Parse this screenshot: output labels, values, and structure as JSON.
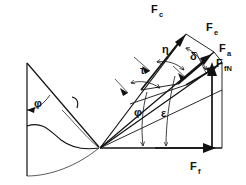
{
  "figure": {
    "background_color": "#ffffff",
    "stroke_color": "#111111"
  },
  "forces": [
    {
      "id": "Fc",
      "base": "F",
      "sub": "c",
      "label": "F_c",
      "label_x": 151,
      "label_y": 13,
      "description": "cutting force vector, upper left of force polygon"
    },
    {
      "id": "Fe",
      "base": "F",
      "sub": "e",
      "label": "F_e",
      "label_x": 206,
      "label_y": 31,
      "description": "effective / resultant force vector"
    },
    {
      "id": "Fa",
      "base": "F",
      "sub": "a",
      "label": "F_a",
      "label_x": 219,
      "label_y": 52,
      "description": "active force vector"
    },
    {
      "id": "FfN",
      "base": "F",
      "sub": "fN",
      "label": "F_fN",
      "label_x": 218,
      "label_y": 66,
      "description": "feed normal force, vertical arrow"
    },
    {
      "id": "Ff",
      "base": "F",
      "sub": "f",
      "label": "F_f",
      "label_x": 190,
      "label_y": 170,
      "description": "feed force, horizontal arrow along baseline"
    }
  ],
  "angles": [
    {
      "id": "phi_tool",
      "symbol": "φ",
      "label_x": 34,
      "label_y": 103,
      "description": "tool included angle at left, between vertical reference and tool flank"
    },
    {
      "id": "eta",
      "symbol": "η",
      "label_x": 164,
      "label_y": 50,
      "description": "angle between Fc direction and adjacent ray"
    },
    {
      "id": "tau",
      "symbol": "τ",
      "label_x": 143,
      "label_y": 70,
      "description": "angle measured on outer arc of ray fan"
    },
    {
      "id": "delta",
      "symbol": "δ",
      "label_x": 192,
      "label_y": 57,
      "description": "angle near Fe / Fa vectors"
    },
    {
      "id": "phi_fan",
      "symbol": "φ",
      "label_x": 139,
      "label_y": 112,
      "description": "angle between baseline and intermediate ray"
    },
    {
      "id": "epsilon",
      "symbol": "ε",
      "label_x": 167,
      "label_y": 113,
      "description": "angle between baseline and outer ray"
    }
  ],
  "geometry": {
    "origin": {
      "x": 100,
      "y": 148,
      "name": "cutting-edge-origin"
    },
    "baseline": {
      "x1": 100,
      "y1": 148,
      "x2": 222,
      "y2": 148,
      "name": "horizontal-baseline"
    },
    "vertical_reference": {
      "x1": 27,
      "y1": 63,
      "x2": 27,
      "y2": 176,
      "name": "vertical-reference-line"
    },
    "vertical_force_line": {
      "x1": 222,
      "y1": 148,
      "x2": 222,
      "y2": 62,
      "name": "ffn-vertical-line"
    }
  }
}
